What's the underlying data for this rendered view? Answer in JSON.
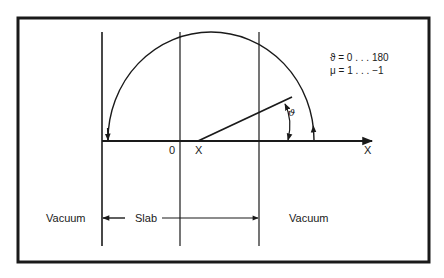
{
  "figure": {
    "type": "geometry-schematic",
    "colors": {
      "ink": "#1a1a1a",
      "background": "#ffffff"
    }
  },
  "labels": {
    "origin": "0",
    "x_position": "X",
    "x_axis": "X",
    "angle_symbol": "ϑ",
    "vacuum_left": "Vacuum",
    "slab": "Slab",
    "vacuum_right": "Vacuum"
  },
  "annotation": {
    "line1": "ϑ = 0 . . . 180",
    "line2": "μ = 1 . . . −1"
  }
}
